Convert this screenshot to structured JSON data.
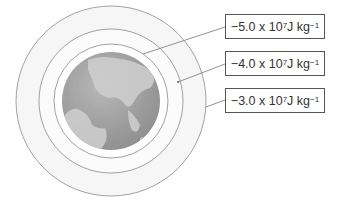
{
  "diagram": {
    "type": "equipotential-surfaces",
    "labels": [
      {
        "prefix": "−5.0 x 10",
        "exp": "7",
        "unit": " J kg",
        "unit_exp": "−1"
      },
      {
        "prefix": "−4.0 x 10",
        "exp": "7",
        "unit": " J kg",
        "unit_exp": "−1"
      },
      {
        "prefix": "−3.0 x 10",
        "exp": "7",
        "unit": " J kg",
        "unit_exp": "−1"
      }
    ],
    "colors": {
      "ring_stroke": "#888888",
      "ring_fill": "#f4f4f4",
      "earth_ocean": "#a9a9a9",
      "earth_land": "#c8c8c8",
      "box_border": "#555555"
    }
  }
}
